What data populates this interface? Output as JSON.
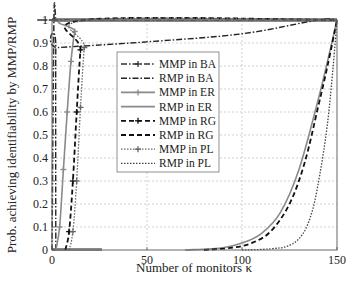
{
  "chart_data": {
    "type": "line",
    "title": "",
    "xlabel": "Number of monitors κ",
    "ylabel": "Prob. achieving identifiability by MMP/RMP",
    "xlim": [
      0,
      150
    ],
    "ylim": [
      0,
      1
    ],
    "xticks": [
      0,
      50,
      100,
      150
    ],
    "yticks": [
      0,
      0.1,
      0.2,
      0.3,
      0.4,
      0.5,
      0.6,
      0.7,
      0.8,
      0.9,
      1
    ],
    "ytick_labels": [
      "0",
      "0.1",
      "0.2",
      "0.3",
      "0.4",
      "0.5",
      "0.6",
      "0.7",
      "0.8",
      "0.9",
      "1"
    ],
    "grid": true,
    "legend_position": "upper center-left (inside)",
    "series": [
      {
        "name": "MMP in BA",
        "style": "dashdot-plus",
        "color": "#333333",
        "x": [
          0,
          1,
          2,
          3,
          150
        ],
        "y": [
          0,
          1,
          1,
          1,
          1
        ]
      },
      {
        "name": "RMP in BA",
        "style": "dashdot",
        "color": "#222222",
        "x": [
          2,
          2,
          3,
          50,
          100,
          140,
          150
        ],
        "y": [
          0,
          0.88,
          0.88,
          0.905,
          0.94,
          1,
          1
        ]
      },
      {
        "name": "MMP in ER",
        "style": "solid-plus",
        "color": "#8a8a8a",
        "x": [
          2,
          4,
          6,
          8,
          10,
          12,
          14,
          150
        ],
        "y": [
          0,
          0.1,
          0.35,
          0.6,
          0.82,
          0.95,
          1,
          1
        ]
      },
      {
        "name": "RMP in ER",
        "style": "solid",
        "color": "#8a8a8a",
        "x": [
          70,
          90,
          100,
          110,
          120,
          130,
          140,
          145,
          150
        ],
        "y": [
          0,
          0.01,
          0.03,
          0.07,
          0.16,
          0.35,
          0.65,
          0.82,
          1
        ]
      },
      {
        "name": "MMP in RG",
        "style": "dashed-plus",
        "color": "#111111",
        "x": [
          7,
          9,
          11,
          13,
          15,
          17,
          150
        ],
        "y": [
          0,
          0.08,
          0.3,
          0.6,
          0.87,
          1,
          1
        ]
      },
      {
        "name": "RMP in RG",
        "style": "dashed",
        "color": "#111111",
        "x": [
          80,
          95,
          105,
          115,
          125,
          133,
          140,
          145,
          150
        ],
        "y": [
          0,
          0.01,
          0.03,
          0.08,
          0.2,
          0.38,
          0.62,
          0.8,
          1
        ]
      },
      {
        "name": "MMP in PL",
        "style": "dotted-plus",
        "color": "#666666",
        "x": [
          9,
          11,
          13,
          15,
          17,
          19,
          150
        ],
        "y": [
          0,
          0.08,
          0.3,
          0.62,
          0.88,
          1,
          1
        ]
      },
      {
        "name": "RMP in PL",
        "style": "dotted",
        "color": "#444444",
        "x": [
          100,
          115,
          125,
          132,
          137,
          141,
          145,
          148,
          150
        ],
        "y": [
          0,
          0.005,
          0.02,
          0.07,
          0.17,
          0.33,
          0.55,
          0.8,
          1
        ]
      }
    ]
  },
  "axes": {
    "xlabel": "Number of monitors κ",
    "ylabel": "Prob. achieving identifiability by MMP/RMP",
    "xtick_labels": [
      "0",
      "50",
      "100",
      "150"
    ]
  },
  "legend": {
    "items": [
      {
        "label": "MMP in BA"
      },
      {
        "label": "RMP in BA"
      },
      {
        "label": "MMP in ER"
      },
      {
        "label": "RMP in ER"
      },
      {
        "label": "MMP in RG"
      },
      {
        "label": "RMP in RG"
      },
      {
        "label": "MMP in PL"
      },
      {
        "label": "RMP in PL"
      }
    ]
  }
}
